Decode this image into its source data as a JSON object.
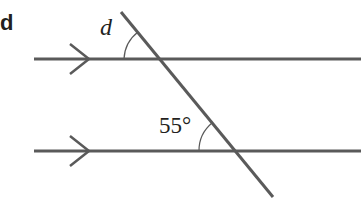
{
  "part_label": "d",
  "diagram": {
    "parallel_lines": 2,
    "angles": [
      {
        "label": "d",
        "position": "top intersection, upper-left angle between parallel line and transversal"
      },
      {
        "label": "55°",
        "position": "bottom intersection, upper-left angle between parallel line and transversal"
      }
    ],
    "colors": {
      "line": "#5a5a5a",
      "text": "#231f20"
    }
  }
}
